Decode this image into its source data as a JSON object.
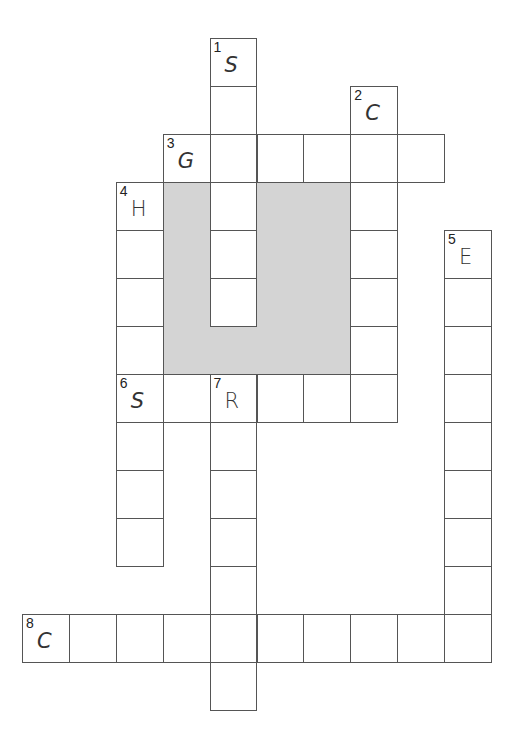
{
  "puzzle": {
    "type": "crossword",
    "grid": {
      "origin_x": 22,
      "origin_y": 38,
      "cell_width": 46.9,
      "cell_height": 48
    },
    "shaded_region": {
      "col_start": 3,
      "col_end": 6,
      "row_start": 3,
      "row_end": 6,
      "color": "#d4d4d4"
    },
    "clues": [
      {
        "number": "1",
        "direction": "down",
        "first_letter": "S",
        "row": 0,
        "col": 4,
        "length": 6
      },
      {
        "number": "2",
        "direction": "down",
        "first_letter": "C",
        "row": 1,
        "col": 7,
        "length": 7
      },
      {
        "number": "3",
        "direction": "across",
        "first_letter": "G",
        "row": 2,
        "col": 3,
        "length": 6
      },
      {
        "number": "4",
        "direction": "down",
        "first_letter": "H",
        "row": 3,
        "col": 2,
        "length": 8
      },
      {
        "number": "5",
        "direction": "down",
        "first_letter": "E",
        "row": 4,
        "col": 9,
        "length": 9
      },
      {
        "number": "6",
        "direction": "across",
        "first_letter": "S",
        "row": 7,
        "col": 2,
        "length": 6
      },
      {
        "number": "7",
        "direction": "down",
        "first_letter": "R",
        "row": 7,
        "col": 4,
        "length": 7
      },
      {
        "number": "8",
        "direction": "across",
        "first_letter": "C",
        "row": 12,
        "col": 0,
        "length": 10
      }
    ]
  }
}
